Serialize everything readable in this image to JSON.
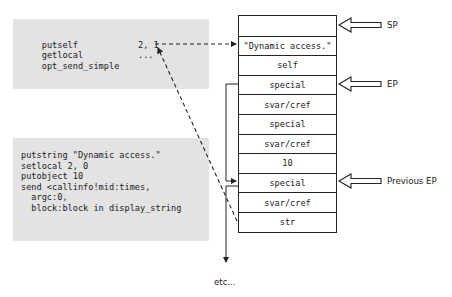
{
  "code_block_1": {
    "lines": [
      {
        "op": "putself",
        "arg": ""
      },
      {
        "op": "getlocal",
        "arg": "2, 1"
      },
      {
        "op": "opt_send_simple",
        "arg": "..."
      }
    ]
  },
  "code_block_2": {
    "lines": [
      "putstring \"Dynamic access.\"",
      "setlocal 2, 0",
      "putobject 10",
      "send <callinfo!mid:times,",
      "  argc:0,",
      "  block:block in display_string"
    ]
  },
  "stack": {
    "cells": [
      "",
      "\"Dynamic access.\"",
      "self",
      "special",
      "svar/cref",
      "special",
      "svar/cref",
      "10",
      "special",
      "svar/cref",
      "str"
    ]
  },
  "pointers": {
    "sp": "SP",
    "ep": "EP",
    "previous_ep": "Previous EP"
  },
  "footer": {
    "etc": "etc..."
  }
}
